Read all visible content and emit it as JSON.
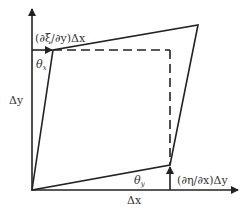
{
  "diagram": {
    "type": "shear-strain-deformation",
    "colors": {
      "stroke": "#222222",
      "text": "#333333",
      "background": "#ffffff"
    },
    "labels": {
      "top_shift": "(∂ξ/∂y)Δx",
      "right_shift": "(∂η/∂x)Δy",
      "theta_x": "θ",
      "theta_x_sub": "x",
      "theta_y": "θ",
      "theta_y_sub": "y",
      "delta_y": "Δy",
      "delta_x": "Δx"
    },
    "elements": {
      "axes": [
        "x-axis",
        "y-axis"
      ],
      "undeformed_square": "dashed",
      "deformed_shape": "solid quadrilateral",
      "arrows": [
        "top-shift-arrow",
        "right-shift-arrow"
      ]
    }
  }
}
